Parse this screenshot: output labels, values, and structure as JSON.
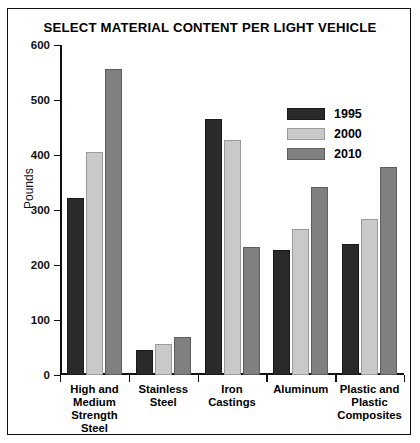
{
  "chart_data": {
    "type": "bar",
    "title": "SELECT MATERIAL CONTENT PER LIGHT VEHICLE",
    "xlabel": "",
    "ylabel": "Pounds",
    "ylim": [
      0,
      600
    ],
    "yticks": [
      0,
      100,
      200,
      300,
      400,
      500,
      600
    ],
    "ytick_labels": [
      "0",
      "100",
      "200",
      "300",
      "400",
      "500",
      "600"
    ],
    "grid": false,
    "legend_position": "upper right",
    "categories": [
      "High and Medium Strength Steel",
      "Stainless Steel",
      "Iron Castings",
      "Aluminum",
      "Plastic and Plastic Composites"
    ],
    "category_label_lines": [
      [
        "High and",
        "Medium",
        "Strength",
        "Steel"
      ],
      [
        "Stainless",
        "Steel"
      ],
      [
        "Iron",
        "Castings"
      ],
      [
        "Aluminum"
      ],
      [
        "Plastic and",
        "Plastic",
        "Composites"
      ]
    ],
    "series": [
      {
        "name": "1995",
        "color": "#2a2a2a",
        "values": [
          322,
          45,
          465,
          228,
          238
        ]
      },
      {
        "name": "2000",
        "color": "#c9c9c9",
        "values": [
          405,
          57,
          428,
          265,
          284
        ]
      },
      {
        "name": "2010",
        "color": "#808080",
        "values": [
          557,
          70,
          233,
          342,
          378
        ]
      }
    ]
  },
  "legend": {
    "entries": [
      {
        "label": "1995"
      },
      {
        "label": "2000"
      },
      {
        "label": "2010"
      }
    ]
  }
}
